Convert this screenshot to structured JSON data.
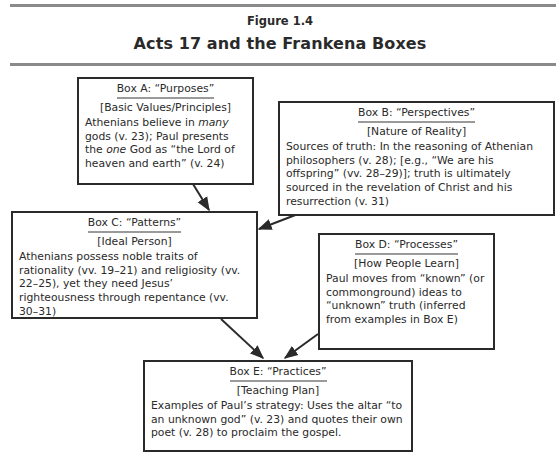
{
  "figure": {
    "label": "Figure 1.4",
    "title": "Acts 17 and the Frankena Boxes"
  },
  "boxes": {
    "a": {
      "heading": "Box A: “Purposes”",
      "subheading": "[Basic Values/Principles]",
      "body_parts": [
        "Athenians believe in ",
        "many",
        " gods (v. 23); Paul presents the ",
        "one",
        " God as “the Lord of heaven and earth” (v. 24)"
      ]
    },
    "b": {
      "heading": "Box B: “Perspectives”",
      "subheading": "[Nature of Reality]",
      "body": "Sources of truth: In the reasoning of Athenian philosophers (v. 28); [e.g., “We are his offspring” (vv. 28–29)]; truth is ultimately sourced in the revelation of Christ and his resurrection (v. 31)"
    },
    "c": {
      "heading": "Box C: “Patterns”",
      "subheading": "[Ideal Person]",
      "body": "Athenians possess noble traits of rationality (vv. 19–21) and religiosity (vv. 22–25), yet they need Jesus’ righteousness through repentance (vv. 30–31)"
    },
    "d": {
      "heading": "Box D: “Processes”",
      "subheading": "[How People Learn]",
      "body": "Paul moves from “known” (or commonground) ideas to “unknown” truth (inferred from examples in Box E)"
    },
    "e": {
      "heading": "Box E: “Practices”",
      "subheading": "[Teaching Plan]",
      "body": "Examples of Paul’s strategy: Uses the altar “to an unknown god” (v. 23) and quotes their own poet (v. 28) to proclaim the gospel."
    }
  },
  "arrows": [
    {
      "from": "Box A",
      "to": "Box C"
    },
    {
      "from": "Box B",
      "to": "Box C"
    },
    {
      "from": "Box C",
      "to": "Box E"
    },
    {
      "from": "Box D",
      "to": "Box E"
    }
  ],
  "colors": {
    "ink": "#2a2a2a",
    "rule": "#8a8a8a",
    "underline": "#9a9a9a"
  }
}
